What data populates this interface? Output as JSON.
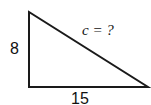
{
  "diagram": {
    "type": "right-triangle",
    "vertices": {
      "top": [
        29,
        12
      ],
      "right_angle": [
        29,
        87
      ],
      "right": [
        148,
        87
      ]
    },
    "labels": {
      "vertical_leg": "8",
      "horizontal_leg": "15",
      "hypotenuse_var": "c",
      "hypotenuse_rest": " = ?"
    },
    "stroke_color": "#1a1a1a"
  }
}
